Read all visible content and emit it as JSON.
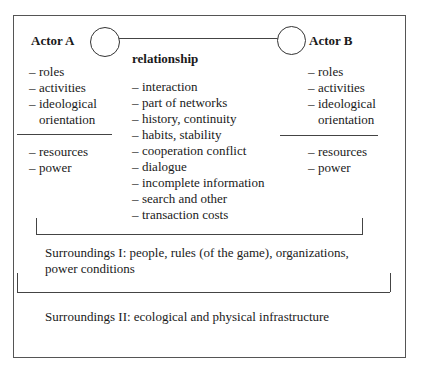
{
  "actor_a": {
    "label": "Actor A",
    "attributes": [
      "roles",
      "activities",
      "ideological",
      "orientation"
    ],
    "capacities": [
      "resources",
      "power"
    ]
  },
  "actor_b": {
    "label": "Actor B",
    "attributes": [
      "roles",
      "activities",
      "ideological",
      "orientation"
    ],
    "capacities": [
      "resources",
      "power"
    ]
  },
  "relationship": {
    "label": "relationship",
    "items": [
      "interaction",
      "part of networks",
      "history, continuity",
      "habits, stability",
      "cooperation conflict",
      "dialogue",
      "incomplete information",
      "search and other",
      "transaction costs"
    ]
  },
  "surroundings_1": {
    "line1": "Surroundings I: people, rules (of the game), organizations,",
    "line2": "power conditions"
  },
  "surroundings_2": {
    "label": "Surroundings II: ecological and physical infrastructure"
  },
  "dash": "–",
  "colors": {
    "line": "#444444",
    "text": "#1a1a1a",
    "background": "#ffffff"
  }
}
